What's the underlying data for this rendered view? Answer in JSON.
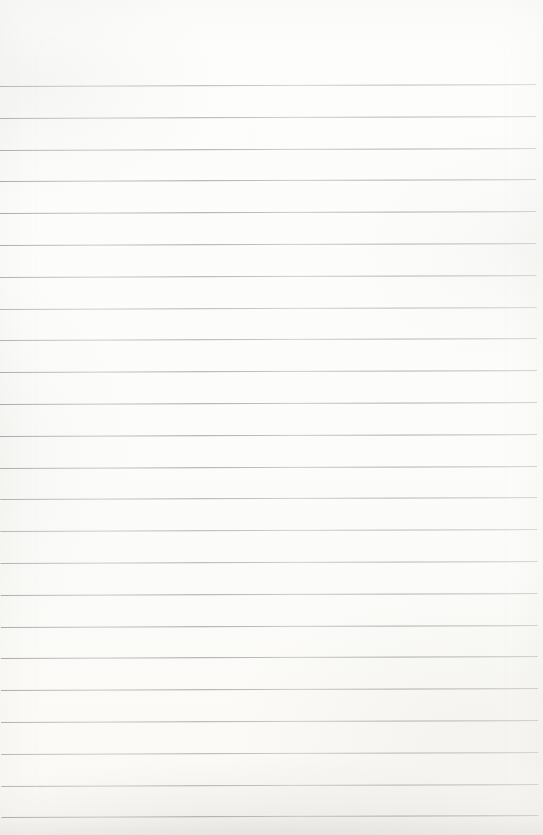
{
  "page": {
    "kind": "blank ruled notebook page (scanned, no writing)",
    "width_px": 543,
    "height_px": 835,
    "paper_color": "#fcfcfa",
    "rule_line_color": "#7c7c7e",
    "rule_line_count": 24,
    "first_line_y_px": 85,
    "line_spacing_px": 31.8,
    "line_left_px": 0,
    "line_width_px": 537,
    "line_tilt_deg": -0.2,
    "visible_text": ""
  }
}
